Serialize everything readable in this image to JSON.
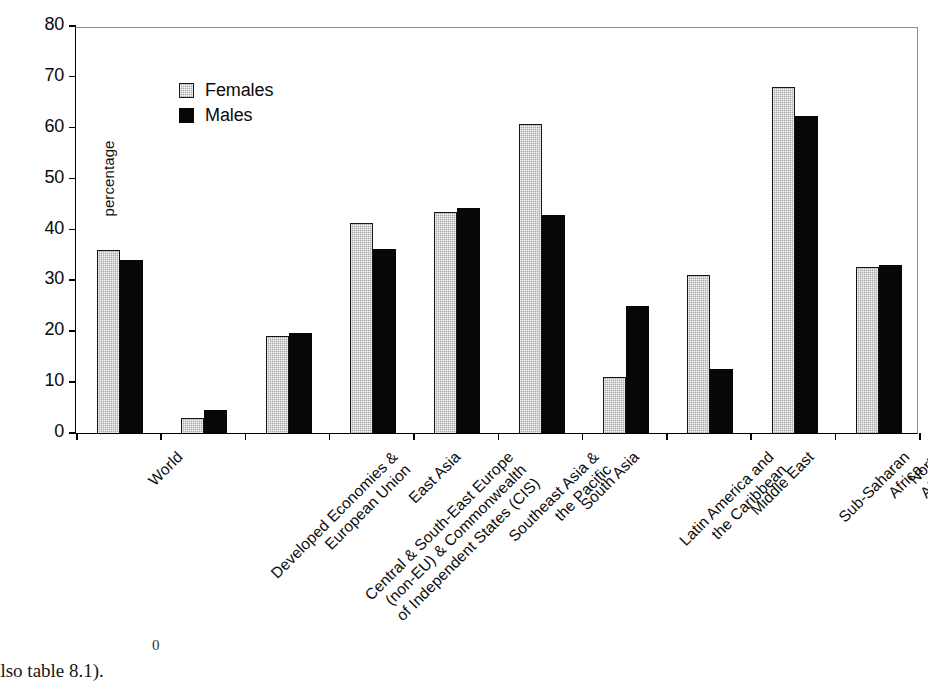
{
  "chart_data": {
    "type": "bar",
    "title": "",
    "xlabel": "",
    "ylabel": "percentage",
    "ylim": [
      0,
      80
    ],
    "yticks": [
      0,
      10,
      20,
      30,
      40,
      50,
      60,
      70,
      80
    ],
    "ytick_labels": [
      "0",
      "10",
      "20",
      "30",
      "40",
      "50",
      "60",
      "70",
      "80"
    ],
    "grid": false,
    "legend_position": "upper-left",
    "categories": [
      "World",
      "Developed Economies &\nEuropean Union",
      "Central & South-East Europe\n(non-EU) & Commonwealth\nof Independent States (CIS)",
      "East Asia",
      "Southeast Asia &\nthe Pacific",
      "South Asia",
      "Latin America and\nthe Caribbean",
      "Middle East",
      "Sub-Saharan\nAfrica",
      "North Africa"
    ],
    "series": [
      {
        "name": "Females",
        "color": "#a8a8a8",
        "values": [
          36.0,
          3.0,
          19.1,
          41.2,
          43.4,
          60.7,
          11.0,
          31.1,
          68.0,
          32.7
        ]
      },
      {
        "name": "Males",
        "color": "#070707",
        "values": [
          34.0,
          4.5,
          19.6,
          36.2,
          44.3,
          42.8,
          24.9,
          12.5,
          62.3,
          33.0
        ]
      }
    ]
  },
  "legend": {
    "items": [
      {
        "label": "Females",
        "swatch": "females"
      },
      {
        "label": "Males",
        "swatch": "males"
      }
    ]
  },
  "caption": {
    "text": "also table 8.1).",
    "stray": "0"
  }
}
